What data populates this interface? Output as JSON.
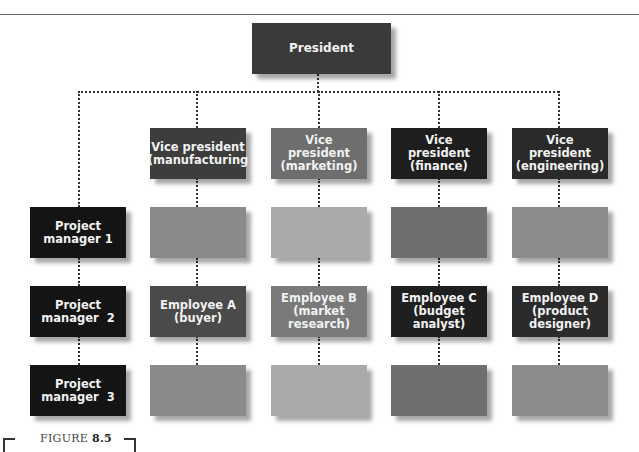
{
  "figure": {
    "label": "FIGURE",
    "number": "8.5"
  },
  "president": {
    "label": "President",
    "color": "#3a3a3a"
  },
  "vice_presidents": [
    {
      "label": "Vice president (manufacturing",
      "color": "#3d3d3d"
    },
    {
      "label": "Vice president (marketing)",
      "color": "#6e6e6e"
    },
    {
      "label": "Vice president (finance)",
      "color": "#1e1e1e"
    },
    {
      "label": "Vice president (engineering)",
      "color": "#2a2a2a"
    }
  ],
  "project_managers": [
    {
      "label": "Project manager 1",
      "color": "#141414"
    },
    {
      "label": "Project manager  2",
      "color": "#141414"
    },
    {
      "label": "Project manager  3",
      "color": "#141414"
    }
  ],
  "rows": [
    {
      "cells": [
        {
          "label": "",
          "color": "#8a8a8a"
        },
        {
          "label": "",
          "color": "#aaaaaa"
        },
        {
          "label": "",
          "color": "#6f6f6f"
        },
        {
          "label": "",
          "color": "#8c8c8c"
        }
      ]
    },
    {
      "cells": [
        {
          "label": "Employee A (buyer)",
          "color": "#4a4a4a"
        },
        {
          "label": "Employee B (market research)",
          "color": "#7a7a7a"
        },
        {
          "label": "Employee C (budget analyst)",
          "color": "#1f1f1f"
        },
        {
          "label": "Employee D (product designer)",
          "color": "#2b2b2b"
        }
      ]
    },
    {
      "cells": [
        {
          "label": "",
          "color": "#8a8a8a"
        },
        {
          "label": "",
          "color": "#aaaaaa"
        },
        {
          "label": "",
          "color": "#6f6f6f"
        },
        {
          "label": "",
          "color": "#8c8c8c"
        }
      ]
    }
  ]
}
